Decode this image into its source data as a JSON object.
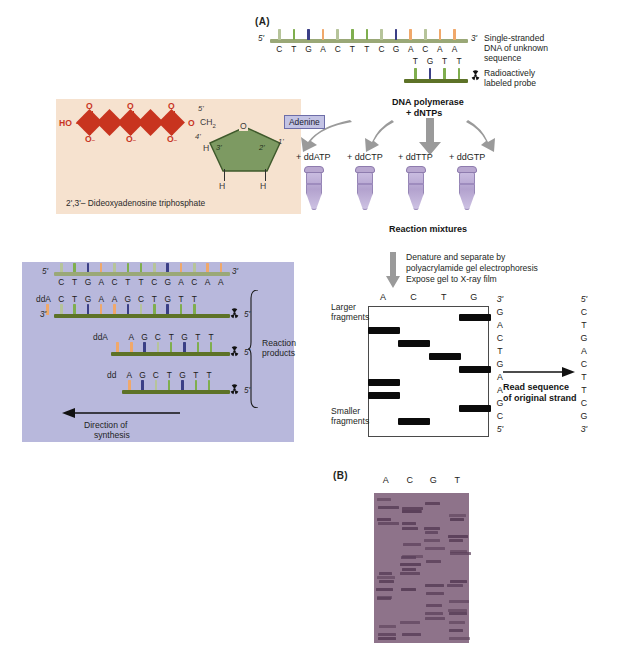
{
  "figure": {
    "panel_a_label": "(A)",
    "panel_b_label": "(B)"
  },
  "template_strand": {
    "five_prime": "5'",
    "three_prime": "3'",
    "sequence": [
      "C",
      "T",
      "G",
      "A",
      "C",
      "T",
      "T",
      "C",
      "G",
      "A",
      "C",
      "A",
      "A"
    ],
    "caption_line1": "Single-stranded",
    "caption_line2": "DNA of unknown",
    "caption_line3": "sequence"
  },
  "probe": {
    "sequence": [
      "T",
      "G",
      "T",
      "T"
    ],
    "caption_line1": "Radioactively",
    "caption_line2": "labeled probe",
    "icon": "radioactive-trefoil-icon"
  },
  "enzyme_step": {
    "line1": "DNA polymerase",
    "line2": "+ dNTPs"
  },
  "ddntp_structure": {
    "hydroxyl": "HO",
    "phosphorus": [
      "P",
      "P",
      "P"
    ],
    "oxygen_bridge": [
      "O",
      "O"
    ],
    "double_bond_o": [
      "O",
      "O",
      "O"
    ],
    "minus_o": [
      "O",
      "O",
      "O"
    ],
    "ch2": "CH",
    "ch2_sub": "2",
    "ring_o": "O",
    "carbons": [
      "5'",
      "4'",
      "3'",
      "2'",
      "1'"
    ],
    "hydrogens": [
      "H",
      "H",
      "H",
      "H"
    ],
    "base_label": "Adenine",
    "caption": "2',3'– Dideoxyadenosine triphosphate"
  },
  "tubes": {
    "labels": [
      "+ ddATP",
      "+ ddCTP",
      "+ ddTTP",
      "+ ddGTP"
    ],
    "caption": "Reaction mixtures"
  },
  "electrophoresis_step": {
    "line1": "Denature and separate by",
    "line2": "polyacrylamide gel electrophoresis",
    "line3": "Expose gel to X-ray film"
  },
  "reaction_products": {
    "template_sequence": [
      "C",
      "T",
      "G",
      "A",
      "C",
      "T",
      "T",
      "C",
      "G",
      "A",
      "C",
      "A",
      "A"
    ],
    "product_1": {
      "terminator": "ddA",
      "sequence": [
        "C",
        "T",
        "G",
        "A",
        "A",
        "G",
        "C",
        "T",
        "G",
        "T",
        "T"
      ],
      "five_prime": "5'",
      "three_prime": "3'"
    },
    "product_2": {
      "terminator": "ddA",
      "sequence": [
        "A",
        "G",
        "C",
        "T",
        "G",
        "T",
        "T"
      ],
      "five_prime": "5'"
    },
    "product_3": {
      "terminator": "dd",
      "sequence": [
        "A",
        "G",
        "C",
        "T",
        "G",
        "T",
        "T"
      ],
      "five_prime": "5'"
    },
    "bracket_label_line1": "Reaction",
    "bracket_label_line2": "products",
    "direction_line1": "Direction of",
    "direction_line2": "synthesis",
    "five_prime": "5'",
    "three_prime": "3'"
  },
  "gel": {
    "lane_headers": [
      "A",
      "C",
      "T",
      "G"
    ],
    "larger_label_line1": "Larger",
    "larger_label_line2": "fragments",
    "smaller_label_line1": "Smaller",
    "smaller_label_line2": "fragments",
    "bands": [
      {
        "lane": "G",
        "position": 0
      },
      {
        "lane": "A",
        "position": 1
      },
      {
        "lane": "C",
        "position": 2
      },
      {
        "lane": "T",
        "position": 3
      },
      {
        "lane": "G",
        "position": 4
      },
      {
        "lane": "A",
        "position": 5
      },
      {
        "lane": "A",
        "position": 6
      },
      {
        "lane": "G",
        "position": 7
      },
      {
        "lane": "C",
        "position": 8
      }
    ],
    "read_column": {
      "top": "3'",
      "letters": [
        "G",
        "A",
        "C",
        "T",
        "G",
        "A",
        "A",
        "G",
        "C"
      ],
      "bottom": "5'"
    },
    "original_column": {
      "top": "5'",
      "letters": [
        "C",
        "T",
        "G",
        "A",
        "C",
        "T",
        "T",
        "C",
        "G"
      ],
      "bottom": "3'"
    },
    "read_label_line1": "Read sequence",
    "read_label_line2": "of original strand"
  },
  "autoradiogram": {
    "lane_headers": [
      "A",
      "C",
      "G",
      "T"
    ]
  },
  "colors": {
    "base_A": "#f0a86a",
    "base_T": "#7fae4e",
    "base_G": "#3b3f86",
    "base_C": "#b6c49a",
    "backbone_light": "#9aa877",
    "backbone_dark": "#5d7227",
    "phosphate_red": "#c8341f",
    "sugar_green": "#7d9a62",
    "beige_panel": "#f6e2cf",
    "lavender_panel": "#b8b8dc",
    "film_purple": "#8e738a",
    "band_black": "#0b0b0b"
  }
}
